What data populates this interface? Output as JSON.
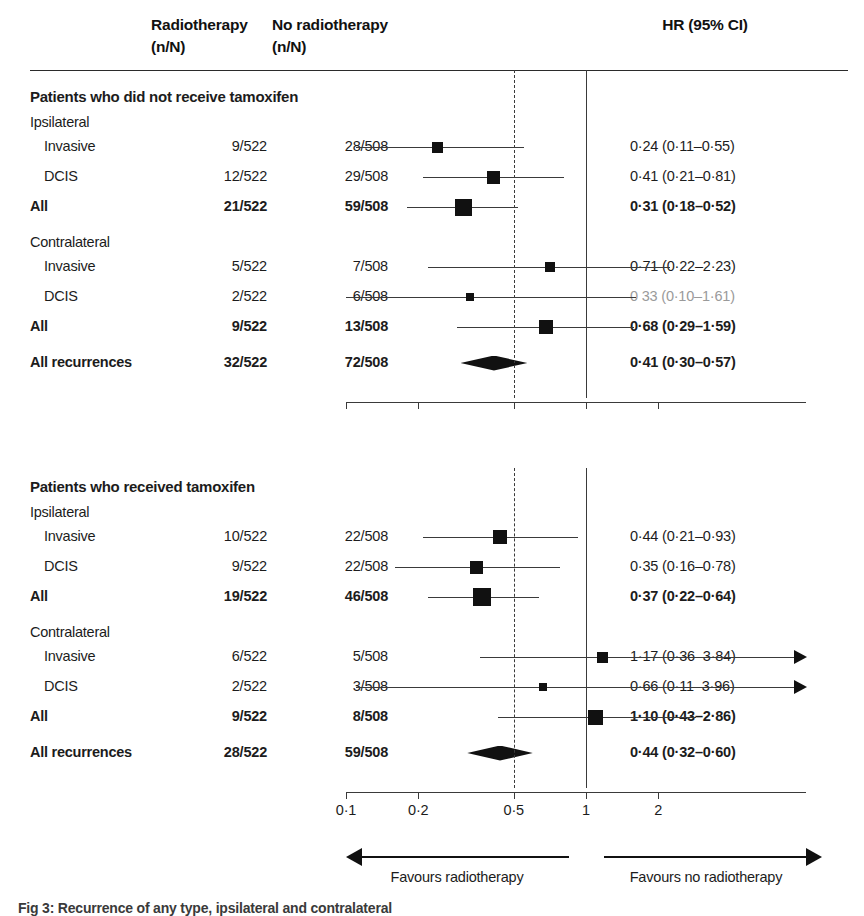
{
  "header": {
    "col_rt_line1": "Radiotherapy",
    "col_rt_line2": "(n/N)",
    "col_nrt_line1": "No radiotherapy",
    "col_nrt_line2": "(n/N)",
    "col_hr": "HR (95% CI)"
  },
  "axis": {
    "ticks": [
      "0·1",
      "0·2",
      "0·5",
      "1",
      "2"
    ],
    "tick_values": [
      0.1,
      0.2,
      0.5,
      1,
      2
    ],
    "scale": "log",
    "null_line": 1,
    "dashed_line": 0.5
  },
  "legend": {
    "left": "Favours radiotherapy",
    "right": "Favours no radiotherapy"
  },
  "caption": "Fig 3: Recurrence of any type, ipsilateral and contralateral",
  "panels": [
    {
      "title": "Patients who did not receive tamoxifen",
      "groups": [
        {
          "name": "Ipsilateral",
          "rows": [
            {
              "label": "Invasive",
              "rt": "9/522",
              "nrt": "28/508",
              "hr": "0·24 (0·11–0·55)",
              "bold": false,
              "faded": false
            },
            {
              "label": "DCIS",
              "rt": "12/522",
              "nrt": "29/508",
              "hr": "0·41 (0·21–0·81)",
              "bold": false,
              "faded": false
            },
            {
              "label": "All",
              "rt": "21/522",
              "nrt": "59/508",
              "hr": "0·31 (0·18–0·52)",
              "bold": true,
              "faded": false
            }
          ]
        },
        {
          "name": "Contralateral",
          "rows": [
            {
              "label": "Invasive",
              "rt": "5/522",
              "nrt": "7/508",
              "hr": "0·71 (0·22–2·23)",
              "bold": false,
              "faded": false
            },
            {
              "label": "DCIS",
              "rt": "2/522",
              "nrt": "6/508",
              "hr": "0 33 (0·10–1·61)",
              "bold": false,
              "faded": true
            },
            {
              "label": "All",
              "rt": "9/522",
              "nrt": "13/508",
              "hr": "0·68 (0·29–1·59)",
              "bold": true,
              "faded": false
            }
          ]
        }
      ],
      "summary": {
        "label": "All recurrences",
        "rt": "32/522",
        "nrt": "72/508",
        "hr": "0·41 (0·30–0·57)",
        "bold": true
      }
    },
    {
      "title": "Patients who received tamoxifen",
      "groups": [
        {
          "name": "Ipsilateral",
          "rows": [
            {
              "label": "Invasive",
              "rt": "10/522",
              "nrt": "22/508",
              "hr": "0·44 (0·21–0·93)",
              "bold": false,
              "faded": false
            },
            {
              "label": "DCIS",
              "rt": "9/522",
              "nrt": "22/508",
              "hr": "0·35 (0·16–0·78)",
              "bold": false,
              "faded": false
            },
            {
              "label": "All",
              "rt": "19/522",
              "nrt": "46/508",
              "hr": "0·37 (0·22–0·64)",
              "bold": true,
              "faded": false
            }
          ]
        },
        {
          "name": "Contralateral",
          "rows": [
            {
              "label": "Invasive",
              "rt": "6/522",
              "nrt": "5/508",
              "hr": "1·17 (0·36–3·84)",
              "bold": false,
              "faded": false
            },
            {
              "label": "DCIS",
              "rt": "2/522",
              "nrt": "3/508",
              "hr": "0·66 (0·11–3·96)",
              "bold": false,
              "faded": false
            },
            {
              "label": "All",
              "rt": "9/522",
              "nrt": "8/508",
              "hr": "1·10 (0·43–2·86)",
              "bold": true,
              "faded": false
            }
          ]
        }
      ],
      "summary": {
        "label": "All recurrences",
        "rt": "28/522",
        "nrt": "59/508",
        "hr": "0·44 (0·32–0·60)",
        "bold": true
      }
    }
  ],
  "chart_data": {
    "type": "forest",
    "xlabel": "HR (95% CI)",
    "xscale": "log",
    "xlim": [
      0.085,
      3.1
    ],
    "xticks": [
      0.1,
      0.2,
      0.5,
      1,
      2
    ],
    "xticklabels": [
      "0·1",
      "0·2",
      "0·5",
      "1",
      "2"
    ],
    "reference_lines": [
      {
        "value": 1,
        "style": "solid"
      },
      {
        "value": 0.5,
        "style": "dashed"
      }
    ],
    "grid": false,
    "legend_position": "below-axis",
    "entries": [
      {
        "panel": "Patients who did not receive tamoxifen",
        "group": "Ipsilateral",
        "label": "Invasive",
        "rt": "9/522",
        "nrt": "28/508",
        "hr": 0.24,
        "lcl": 0.11,
        "ucl": 0.55,
        "marker": "square",
        "size": 11,
        "summary": false,
        "clipped_right": false
      },
      {
        "panel": "Patients who did not receive tamoxifen",
        "group": "Ipsilateral",
        "label": "DCIS",
        "rt": "12/522",
        "nrt": "29/508",
        "hr": 0.41,
        "lcl": 0.21,
        "ucl": 0.81,
        "marker": "square",
        "size": 13,
        "summary": false,
        "clipped_right": false
      },
      {
        "panel": "Patients who did not receive tamoxifen",
        "group": "Ipsilateral",
        "label": "All",
        "rt": "21/522",
        "nrt": "59/508",
        "hr": 0.31,
        "lcl": 0.18,
        "ucl": 0.52,
        "marker": "square",
        "size": 17,
        "summary": false,
        "clipped_right": false
      },
      {
        "panel": "Patients who did not receive tamoxifen",
        "group": "Contralateral",
        "label": "Invasive",
        "rt": "5/522",
        "nrt": "7/508",
        "hr": 0.71,
        "lcl": 0.22,
        "ucl": 2.23,
        "marker": "square",
        "size": 10,
        "summary": false,
        "clipped_right": false
      },
      {
        "panel": "Patients who did not receive tamoxifen",
        "group": "Contralateral",
        "label": "DCIS",
        "rt": "2/522",
        "nrt": "6/508",
        "hr": 0.33,
        "lcl": 0.1,
        "ucl": 1.61,
        "marker": "square",
        "size": 8,
        "summary": false,
        "clipped_right": false
      },
      {
        "panel": "Patients who did not receive tamoxifen",
        "group": "Contralateral",
        "label": "All",
        "rt": "9/522",
        "nrt": "13/508",
        "hr": 0.68,
        "lcl": 0.29,
        "ucl": 1.59,
        "marker": "square",
        "size": 14,
        "summary": false,
        "clipped_right": false
      },
      {
        "panel": "Patients who did not receive tamoxifen",
        "group": "Overall",
        "label": "All recurrences",
        "rt": "32/522",
        "nrt": "72/508",
        "hr": 0.41,
        "lcl": 0.3,
        "ucl": 0.57,
        "marker": "diamond",
        "size": 0,
        "summary": true,
        "clipped_right": false
      },
      {
        "panel": "Patients who received tamoxifen",
        "group": "Ipsilateral",
        "label": "Invasive",
        "rt": "10/522",
        "nrt": "22/508",
        "hr": 0.44,
        "lcl": 0.21,
        "ucl": 0.93,
        "marker": "square",
        "size": 14,
        "summary": false,
        "clipped_right": false
      },
      {
        "panel": "Patients who received tamoxifen",
        "group": "Ipsilateral",
        "label": "DCIS",
        "rt": "9/522",
        "nrt": "22/508",
        "hr": 0.35,
        "lcl": 0.16,
        "ucl": 0.78,
        "marker": "square",
        "size": 13,
        "summary": false,
        "clipped_right": false
      },
      {
        "panel": "Patients who received tamoxifen",
        "group": "Ipsilateral",
        "label": "All",
        "rt": "19/522",
        "nrt": "46/508",
        "hr": 0.37,
        "lcl": 0.22,
        "ucl": 0.64,
        "marker": "square",
        "size": 18,
        "summary": false,
        "clipped_right": false
      },
      {
        "panel": "Patients who received tamoxifen",
        "group": "Contralateral",
        "label": "Invasive",
        "rt": "6/522",
        "nrt": "5/508",
        "hr": 1.17,
        "lcl": 0.36,
        "ucl": 3.84,
        "marker": "square",
        "size": 11,
        "summary": false,
        "clipped_right": true
      },
      {
        "panel": "Patients who received tamoxifen",
        "group": "Contralateral",
        "label": "DCIS",
        "rt": "2/522",
        "nrt": "3/508",
        "hr": 0.66,
        "lcl": 0.11,
        "ucl": 3.96,
        "marker": "square",
        "size": 8,
        "summary": false,
        "clipped_right": true
      },
      {
        "panel": "Patients who received tamoxifen",
        "group": "Contralateral",
        "label": "All",
        "rt": "9/522",
        "nrt": "8/508",
        "hr": 1.1,
        "lcl": 0.43,
        "ucl": 2.86,
        "marker": "square",
        "size": 15,
        "summary": false,
        "clipped_right": false
      },
      {
        "panel": "Patients who received tamoxifen",
        "group": "Overall",
        "label": "All recurrences",
        "rt": "28/522",
        "nrt": "59/508",
        "hr": 0.44,
        "lcl": 0.32,
        "ucl": 0.6,
        "marker": "diamond",
        "size": 0,
        "summary": true,
        "clipped_right": false
      }
    ]
  }
}
